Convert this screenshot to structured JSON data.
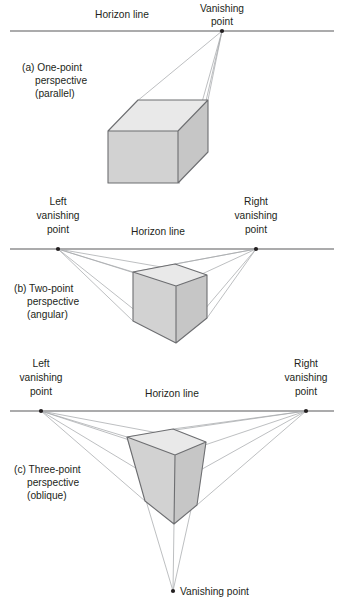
{
  "figure": {
    "background_color": "#ffffff",
    "line_color": "#58595b",
    "ray_color": "#a7a9ac",
    "solid_outline_color": "#6d6e71",
    "face_colors": {
      "top": "#e9e9e9",
      "front": "#d2d2d2",
      "side": "#c6c6c6"
    },
    "text_color": "#231f20"
  },
  "panels": [
    {
      "id": "a",
      "caption_lines": [
        "(a) One-point",
        "perspective",
        "(parallel)"
      ],
      "caption_x": 22,
      "caption_y": 68,
      "horizon": {
        "label": "Horizon line",
        "label_x": 122,
        "label_y": 18,
        "y": 31,
        "x1": 10,
        "x2": 334
      },
      "vanishing_points": [
        {
          "name": "vanishing-point",
          "label_lines": [
            "Vanishing",
            "point"
          ],
          "label_x": 222,
          "label_y": 12,
          "x": 222,
          "y": 31
        }
      ],
      "solid": {
        "type": "rectangular-box",
        "front_face": [
          [
            108,
            131
          ],
          [
            178,
            131
          ],
          [
            178,
            183
          ],
          [
            108,
            183
          ]
        ],
        "top_face": [
          [
            108,
            131
          ],
          [
            138,
            100
          ],
          [
            208,
            100
          ],
          [
            178,
            131
          ]
        ],
        "depth_offset": [
          30,
          -31
        ]
      },
      "rays": [
        [
          [
            222,
            31
          ],
          [
            138,
            100
          ]
        ],
        [
          [
            222,
            31
          ],
          [
            208,
            100
          ]
        ],
        [
          [
            222,
            31
          ],
          [
            178,
            183
          ]
        ]
      ]
    },
    {
      "id": "b",
      "caption_lines": [
        "(b) Two-point",
        "perspective",
        "(angular)"
      ],
      "caption_x": 14,
      "caption_y": 289,
      "horizon": {
        "label": "Horizon line",
        "label_x": 158,
        "label_y": 235,
        "y": 249,
        "x1": 10,
        "x2": 334
      },
      "vanishing_points": [
        {
          "name": "left-vanishing-point",
          "label_lines": [
            "Left",
            "vanishing",
            "point"
          ],
          "label_x": 58,
          "label_y": 205,
          "x": 58,
          "y": 249
        },
        {
          "name": "right-vanishing-point",
          "label_lines": [
            "Right",
            "vanishing",
            "point"
          ],
          "label_x": 256,
          "label_y": 205,
          "x": 256,
          "y": 249
        }
      ],
      "solid": {
        "type": "cube",
        "top_vertex": [
          175,
          264
        ],
        "left_vertex": [
          133,
          272
        ],
        "right_vertex": [
          207,
          275
        ],
        "front_vertex": [
          176,
          286
        ],
        "left_bottom": [
          133,
          321
        ],
        "right_bottom": [
          207,
          318
        ],
        "bottom_vertex": [
          176,
          343
        ]
      }
    },
    {
      "id": "c",
      "caption_lines": [
        "(c) Three-point",
        "perspective",
        "(oblique)"
      ],
      "caption_x": 14,
      "caption_y": 470,
      "horizon": {
        "label": "Horizon line",
        "label_x": 172,
        "label_y": 397,
        "y": 411,
        "x1": 10,
        "x2": 334
      },
      "vanishing_points": [
        {
          "name": "left-vanishing-point",
          "label_lines": [
            "Left",
            "vanishing",
            "point"
          ],
          "label_x": 41,
          "label_y": 367,
          "x": 41,
          "y": 411
        },
        {
          "name": "right-vanishing-point",
          "label_lines": [
            "Right",
            "vanishing",
            "point"
          ],
          "label_x": 306,
          "label_y": 367,
          "x": 306,
          "y": 411
        },
        {
          "name": "bottom-vanishing-point",
          "label_lines": [
            "Vanishing point"
          ],
          "label_x": 182,
          "label_y": 595,
          "x": 173,
          "y": 591
        }
      ],
      "solid": {
        "type": "tapered-cube",
        "top_vertex": [
          173,
          429
        ],
        "left_vertex": [
          127,
          437
        ],
        "right_vertex": [
          206,
          442
        ],
        "front_vertex": [
          175,
          455
        ],
        "left_bottom": [
          145,
          501
        ],
        "right_bottom": [
          197,
          505
        ],
        "bottom_vertex": [
          174,
          524
        ]
      }
    }
  ]
}
